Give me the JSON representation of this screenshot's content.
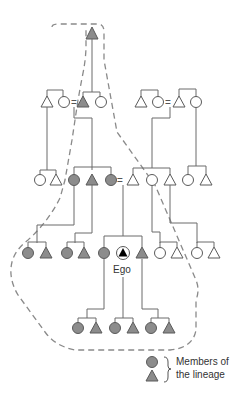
{
  "figure": {
    "type": "kinship-diagram",
    "ego_label": "Ego",
    "marriage_symbol": "=",
    "legend": {
      "brace": "}",
      "label_line1": "Members of",
      "label_line2": "the lineage",
      "symbols": [
        "female (circle, shaded)",
        "male (triangle, shaded)"
      ]
    },
    "colors": {
      "lineage_fill": "#8c8c8c",
      "non_lineage_fill": "#ffffff",
      "line": "#6b6b6b",
      "boundary_dash": "#8a8a8a"
    },
    "generations": [
      {
        "row": 1,
        "members": [
          {
            "sex": "male",
            "lineage": true
          }
        ]
      },
      {
        "row": 2,
        "members": [
          {
            "sex": "male",
            "lineage": false
          },
          {
            "sex": "female",
            "lineage": false
          },
          {
            "sex": "male",
            "lineage": true
          },
          {
            "sex": "female",
            "lineage": false
          },
          {
            "sex": "male",
            "lineage": false
          },
          {
            "sex": "female",
            "lineage": false
          },
          {
            "sex": "male",
            "lineage": false
          },
          {
            "sex": "female",
            "lineage": false
          }
        ]
      },
      {
        "row": 3,
        "members": [
          {
            "sex": "female",
            "lineage": false
          },
          {
            "sex": "male",
            "lineage": false
          },
          {
            "sex": "female",
            "lineage": true
          },
          {
            "sex": "male",
            "lineage": true
          },
          {
            "sex": "female",
            "lineage": true
          },
          {
            "sex": "male",
            "lineage": false
          },
          {
            "sex": "female",
            "lineage": false
          },
          {
            "sex": "male",
            "lineage": false
          },
          {
            "sex": "female",
            "lineage": false
          },
          {
            "sex": "male",
            "lineage": false
          }
        ]
      },
      {
        "row": 4,
        "members": [
          {
            "sex": "female",
            "lineage": true
          },
          {
            "sex": "male",
            "lineage": true
          },
          {
            "sex": "female",
            "lineage": true
          },
          {
            "sex": "male",
            "lineage": true
          },
          {
            "sex": "female",
            "lineage": true
          },
          {
            "sex": "male",
            "lineage": true,
            "ego": true
          },
          {
            "sex": "male",
            "lineage": true
          },
          {
            "sex": "female",
            "lineage": false
          },
          {
            "sex": "male",
            "lineage": false
          },
          {
            "sex": "female",
            "lineage": false
          },
          {
            "sex": "male",
            "lineage": false
          }
        ]
      },
      {
        "row": 5,
        "members": [
          {
            "sex": "female",
            "lineage": true
          },
          {
            "sex": "male",
            "lineage": true
          },
          {
            "sex": "female",
            "lineage": true
          },
          {
            "sex": "male",
            "lineage": true
          },
          {
            "sex": "female",
            "lineage": true
          },
          {
            "sex": "male",
            "lineage": true
          }
        ]
      }
    ]
  }
}
